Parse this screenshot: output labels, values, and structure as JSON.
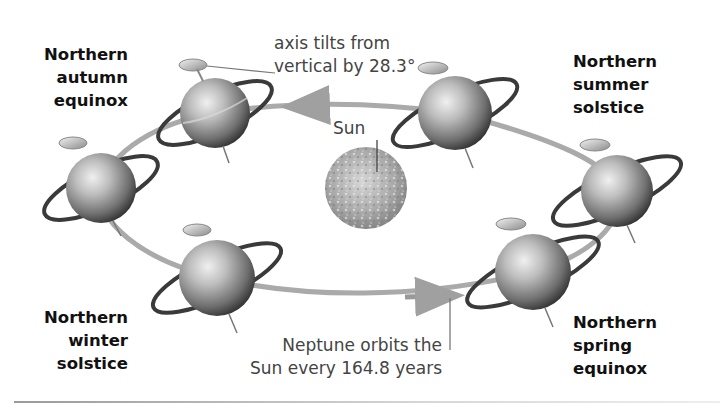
{
  "diagram": {
    "center_body": {
      "label": "Sun"
    },
    "annotations": {
      "axis_tilt": [
        "axis tilts from",
        "vertical by 28.3°"
      ],
      "orbit_period": [
        "Neptune orbits the",
        "Sun every 164.8 years"
      ]
    },
    "season_labels": {
      "autumn_equinox": [
        "Northern",
        "autumn",
        "equinox"
      ],
      "summer_solstice": [
        "Northern",
        "summer",
        "solstice"
      ],
      "winter_solstice": [
        "Northern",
        "winter",
        "solstice"
      ],
      "spring_equinox": [
        "Northern",
        "spring",
        "equinox"
      ]
    },
    "values": {
      "axial_tilt_degrees": 28.3,
      "orbital_period_years": 164.8
    },
    "planet_positions": [
      {
        "name": "planet-upper-left",
        "cx": 215,
        "cy": 113,
        "r": 35
      },
      {
        "name": "planet-upper-right",
        "cx": 455,
        "cy": 113,
        "r": 37
      },
      {
        "name": "planet-far-left",
        "cx": 101,
        "cy": 188,
        "r": 35
      },
      {
        "name": "planet-far-right",
        "cx": 617,
        "cy": 191,
        "r": 36
      },
      {
        "name": "planet-lower-left",
        "cx": 217,
        "cy": 278,
        "r": 38
      },
      {
        "name": "planet-lower-right",
        "cx": 533,
        "cy": 272,
        "r": 38
      }
    ],
    "colors": {
      "orbit": "#a9a9a9",
      "planet_light": "#e2e2e2",
      "planet_dark": "#4a4a4a",
      "ring": "#3a3a3a",
      "sun_light": "#c9c9c9",
      "sun_dark": "#7a7a7a",
      "text_label": "#111111",
      "text_note": "#444444"
    }
  }
}
